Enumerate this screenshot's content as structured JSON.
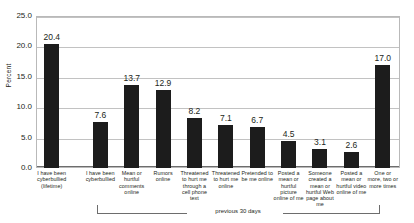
{
  "chart_data": {
    "type": "bar",
    "title": "",
    "xlabel": "",
    "ylabel": "Percent",
    "ylim": [
      0,
      25
    ],
    "ytick_labels": [
      "25.0",
      "20.0",
      "15.0",
      "10.0",
      "5.0",
      "0.0"
    ],
    "ytick_values": [
      25,
      20,
      15,
      10,
      5,
      0
    ],
    "grid": true,
    "legend": "none",
    "categories": [
      "I have been cyberbullied (lifetime)",
      "I have been cyberbullied",
      "Mean or hurtful comments online",
      "Rumors online",
      "Threatened to hurt me through a cell phone text",
      "Threatened to hurt me online",
      "Pretended to be me online",
      "Posted a mean or hurtful picture online of me",
      "Someone created a mean or hurtful Web page about me",
      "Posted a mean or hurtful video online of me",
      "One or more, two or more times"
    ],
    "values": [
      20.4,
      7.6,
      13.7,
      12.9,
      8.2,
      7.1,
      6.7,
      4.5,
      3.1,
      2.6,
      17.0
    ],
    "value_labels": [
      "20.4",
      "7.6",
      "13.7",
      "12.9",
      "8.2",
      "7.1",
      "6.7",
      "4.5",
      "3.1",
      "2.6",
      "17.0"
    ],
    "annotations": [
      {
        "name": "previous-30-days-bracket",
        "text": "previous 30 days",
        "spans_categories": [
          1,
          10
        ]
      }
    ],
    "bar_color": "#1c1c1c"
  }
}
